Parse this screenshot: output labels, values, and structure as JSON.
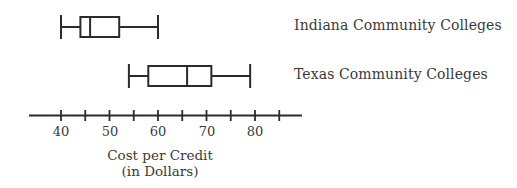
{
  "chart_data": {
    "type": "boxplot",
    "title": "",
    "xlabel": "Cost per Credit (in Dollars)",
    "xlabel_lines": [
      "Cost per Credit",
      "(in Dollars)"
    ],
    "ylabel": "",
    "xlim": [
      33,
      87
    ],
    "ticks": [
      40,
      45,
      50,
      55,
      60,
      65,
      70,
      75,
      80,
      85
    ],
    "tick_labels": [
      "40",
      "50",
      "60",
      "70",
      "80"
    ],
    "grid": false,
    "legend_position": "right of each box (inline labels)",
    "series": [
      {
        "name": "Indiana Community Colleges",
        "min": 40,
        "q1": 44,
        "median": 46,
        "q3": 52,
        "max": 60
      },
      {
        "name": "Texas Community Colleges",
        "min": 54,
        "q1": 58,
        "median": 66,
        "q3": 71,
        "max": 79
      }
    ]
  },
  "labels": {
    "indiana": "Indiana Community Colleges",
    "texas": "Texas Community Colleges",
    "axis_title_line1": "Cost per Credit",
    "axis_title_line2": "(in Dollars)",
    "ticks": [
      "40",
      "50",
      "60",
      "70",
      "80"
    ]
  },
  "colors": {
    "stroke": "#2b2b2b",
    "text": "#3a3a3a",
    "background": "#ffffff"
  }
}
